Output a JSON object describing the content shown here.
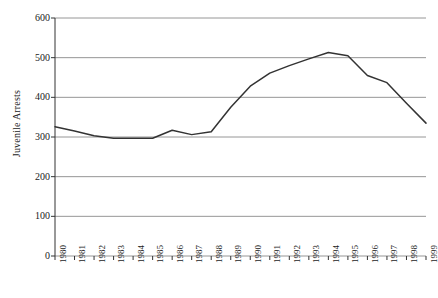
{
  "chart_data": {
    "type": "line",
    "title": "",
    "xlabel": "",
    "ylabel": "Juvenile Arrests",
    "ylim": [
      0,
      600
    ],
    "ytick_values": [
      0,
      100,
      200,
      300,
      400,
      500,
      600
    ],
    "ytick_labels": [
      "0",
      "100",
      "200",
      "300",
      "400",
      "500",
      "600"
    ],
    "grid": true,
    "legend": "none",
    "categories": [
      "1980",
      "1981",
      "1982",
      "1983",
      "1984",
      "1985",
      "1986",
      "1987",
      "1988",
      "1989",
      "1990",
      "1991",
      "1992",
      "1993",
      "1994",
      "1995",
      "1996",
      "1997",
      "1998",
      "1999"
    ],
    "values": [
      326,
      315,
      303,
      297,
      297,
      297,
      317,
      306,
      313,
      375,
      428,
      461,
      480,
      497,
      513,
      505,
      455,
      437,
      385,
      335
    ],
    "series": [
      {
        "name": "Juvenile Arrests",
        "color": "#333333",
        "values": [
          326,
          315,
          303,
          297,
          297,
          297,
          317,
          306,
          313,
          375,
          428,
          461,
          480,
          497,
          513,
          505,
          455,
          437,
          385,
          335
        ]
      }
    ]
  },
  "axis": {
    "y_title": "Juvenile Arrests"
  }
}
